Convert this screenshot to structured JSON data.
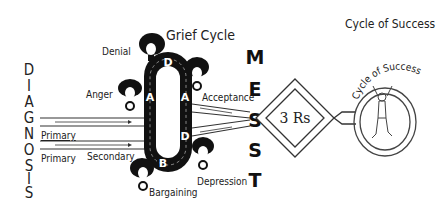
{
  "diagnosis": {
    "letters": [
      "D",
      "I",
      "A",
      "G",
      "N",
      "O",
      "S",
      "I",
      "S"
    ],
    "word": "DIAGNOSIS"
  },
  "arrows": {
    "labels": [
      "Primary",
      "Primary",
      "Secondary"
    ]
  },
  "grief_cycle": {
    "title": "Grief Cycle",
    "stages": [
      {
        "name": "Denial",
        "letter": "D"
      },
      {
        "name": "Anger",
        "letter": "A"
      },
      {
        "name": "Bargaining",
        "letter": "B"
      },
      {
        "name": "Depression",
        "letter": "D"
      },
      {
        "name": "Acceptance",
        "letter": "A"
      }
    ]
  },
  "mest": {
    "letters": [
      "M",
      "E",
      "S",
      "S",
      "T"
    ]
  },
  "diamond": {
    "label": "3 Rs"
  },
  "success": {
    "title": "Cycle of Success",
    "arc_label": "Cycle of Success"
  },
  "colors": {
    "ink": "#111111",
    "background": "#ffffff"
  }
}
